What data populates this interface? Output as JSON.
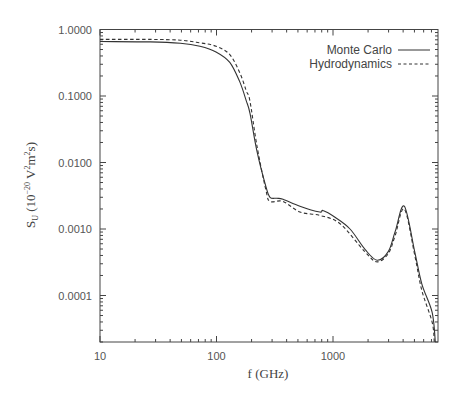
{
  "chart_data": {
    "type": "line",
    "title": "",
    "xlabel": "f (GHz)",
    "ylabel": "S_U (10^-20 V^2 m^2 s)",
    "xscale": "log",
    "yscale": "log",
    "xlim": [
      10,
      7800
    ],
    "ylim": [
      2e-05,
      1.0
    ],
    "x_ticks": [
      10,
      100,
      1000
    ],
    "x_tick_labels": [
      "10",
      "100",
      "1000"
    ],
    "y_ticks": [
      1.0,
      0.1,
      0.01,
      0.001,
      0.0001
    ],
    "y_tick_labels": [
      "1.0000",
      "0.1000",
      "0.0100",
      "0.0010",
      "0.0001"
    ],
    "grid": false,
    "legend_position": "upper right",
    "series": [
      {
        "name": "Monte Carlo",
        "style": "solid",
        "points": [
          [
            10,
            0.66
          ],
          [
            27,
            0.65
          ],
          [
            49,
            0.62
          ],
          [
            72,
            0.56
          ],
          [
            99,
            0.46
          ],
          [
            130,
            0.32
          ],
          [
            159,
            0.16
          ],
          [
            180,
            0.085
          ],
          [
            194,
            0.055
          ],
          [
            222,
            0.015
          ],
          [
            266,
            0.0043
          ],
          [
            288,
            0.003
          ],
          [
            330,
            0.0029
          ],
          [
            372,
            0.0028
          ],
          [
            520,
            0.0022
          ],
          [
            770,
            0.0018
          ],
          [
            820,
            0.0019
          ],
          [
            1040,
            0.0015
          ],
          [
            1400,
            0.001
          ],
          [
            1890,
            0.00049
          ],
          [
            2390,
            0.00034
          ],
          [
            2990,
            0.00046
          ],
          [
            3420,
            0.00092
          ],
          [
            4090,
            0.0022
          ],
          [
            5040,
            0.00045
          ],
          [
            5780,
            0.00015
          ],
          [
            7090,
            5.6e-05
          ],
          [
            7550,
            2e-05
          ]
        ]
      },
      {
        "name": "Hydrodynamics",
        "style": "dashed",
        "points": [
          [
            10,
            0.71
          ],
          [
            27,
            0.71
          ],
          [
            49,
            0.69
          ],
          [
            72,
            0.63
          ],
          [
            99,
            0.56
          ],
          [
            130,
            0.42
          ],
          [
            159,
            0.22
          ],
          [
            180,
            0.12
          ],
          [
            194,
            0.083
          ],
          [
            222,
            0.018
          ],
          [
            266,
            0.0038
          ],
          [
            288,
            0.0026
          ],
          [
            372,
            0.0026
          ],
          [
            520,
            0.0018
          ],
          [
            770,
            0.0016
          ],
          [
            1150,
            0.0012
          ],
          [
            1890,
            0.00045
          ],
          [
            2390,
            0.00032
          ],
          [
            2990,
            0.00043
          ],
          [
            3420,
            0.0008
          ],
          [
            4090,
            0.002
          ],
          [
            5040,
            0.0004
          ],
          [
            5780,
            0.00012
          ],
          [
            7090,
            4e-05
          ],
          [
            7400,
            2e-05
          ]
        ]
      }
    ]
  },
  "legend": {
    "items": [
      {
        "label": "Monte Carlo",
        "style": "solid"
      },
      {
        "label": "Hydrodynamics",
        "style": "dashed"
      }
    ]
  },
  "axes": {
    "xlabel": "f (GHz)",
    "ylabel_main": "S",
    "ylabel_sub": "U",
    "ylabel_rest_open": " (10",
    "ylabel_exp": "−20",
    "ylabel_rest_mid": " V",
    "ylabel_sq1": "2",
    "ylabel_m": "m",
    "ylabel_sq2": "2",
    "ylabel_close": "s)"
  },
  "colors": {
    "line": "#333333",
    "axis": "#444444",
    "text": "#555555"
  }
}
